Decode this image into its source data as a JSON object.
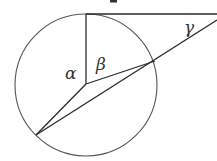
{
  "diagram": {
    "type": "geometry",
    "labels": {
      "alpha": "α",
      "beta": "β",
      "gamma": "γ"
    },
    "colors": {
      "background": "#ffffff",
      "circle": "#555555",
      "lines": "#2a2a2a",
      "labels": "#333333"
    },
    "geometry": {
      "circle": {
        "cx": 86,
        "cy": 85,
        "r": 71
      },
      "points": {
        "center": [
          86,
          84
        ],
        "top_tangent_point": [
          86,
          14
        ],
        "right_intersection": [
          155,
          61
        ],
        "lower_left_point": [
          36,
          135
        ],
        "secant_exit_right": [
          217,
          20
        ],
        "tangent_end_right": [
          217,
          14
        ]
      },
      "segments": [
        {
          "name": "tangent-line",
          "from": "top_tangent_point",
          "to": "tangent_end_right"
        },
        {
          "name": "vertical-radius",
          "from": "top_tangent_point",
          "to": "center"
        },
        {
          "name": "radius-to-right-intersection",
          "from": "center",
          "to": "right_intersection"
        },
        {
          "name": "radius-to-lower-left",
          "from": "center",
          "to": "lower_left_point"
        },
        {
          "name": "secant-line",
          "from": "lower_left_point",
          "to": "secant_exit_right"
        }
      ],
      "label_positions": {
        "alpha": [
          65,
          78
        ],
        "beta": [
          96,
          68
        ],
        "gamma": [
          184,
          32
        ]
      }
    }
  }
}
